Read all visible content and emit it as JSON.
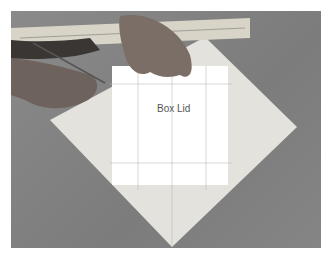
{
  "photo": {
    "description": "Hands using a ruler and pencil to mark fold lines on a square paper turned as a diamond, with a white rectangle labeled Box Lid",
    "label": "Box Lid",
    "colors": {
      "background": "#808080",
      "paper": "#e6e4de",
      "rectangle": "#ffffff"
    }
  }
}
